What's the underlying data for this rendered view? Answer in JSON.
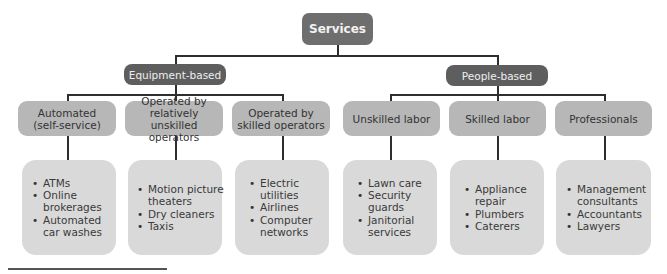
{
  "root": {
    "label": "Services"
  },
  "categories": [
    {
      "label": "Equipment-based",
      "subcategories": [
        {
          "label": "Automated (self-service)",
          "examples": [
            "ATMs",
            "Online brokerages",
            "Automated car washes"
          ]
        },
        {
          "label": "Operated by relatively unskilled operators",
          "examples": [
            "Motion picture theaters",
            "Dry cleaners",
            "Taxis"
          ]
        },
        {
          "label": "Operated by skilled operators",
          "examples": [
            "Electric utilities",
            "Airlines",
            "Computer networks"
          ]
        }
      ]
    },
    {
      "label": "People-based",
      "subcategories": [
        {
          "label": "Unskilled labor",
          "examples": [
            "Lawn care",
            "Security guards",
            "Janitorial services"
          ]
        },
        {
          "label": "Skilled labor",
          "examples": [
            "Appliance repair",
            "Plumbers",
            "Caterers"
          ]
        },
        {
          "label": "Professionals",
          "examples": [
            "Management consultants",
            "Accountants",
            "Lawyers"
          ]
        }
      ]
    }
  ],
  "colors": {
    "root_fill": "#6e6e6e",
    "category_fill": "#5e5e5e",
    "subcategory_fill": "#b7b7b7",
    "example_fill": "#d9d9d9",
    "connector": "#2e2e2e"
  }
}
